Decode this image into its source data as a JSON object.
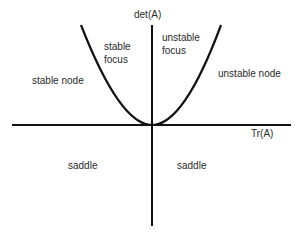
{
  "diagram": {
    "axes": {
      "x_label": "Tr(A)",
      "y_label": "det(A)"
    },
    "curve": "parabola det(A) = Tr(A)^2 / 4",
    "regions": {
      "stable_node": "stable node",
      "stable_focus_line1": "stable",
      "stable_focus_line2": "focus",
      "unstable_focus_line1": "unstable",
      "unstable_focus_line2": "focus",
      "unstable_node": "unstable node",
      "saddle_left": "saddle",
      "saddle_right": "saddle"
    },
    "colors": {
      "line": "#111111",
      "text": "#2a2a2a",
      "background": "#ffffff"
    }
  }
}
